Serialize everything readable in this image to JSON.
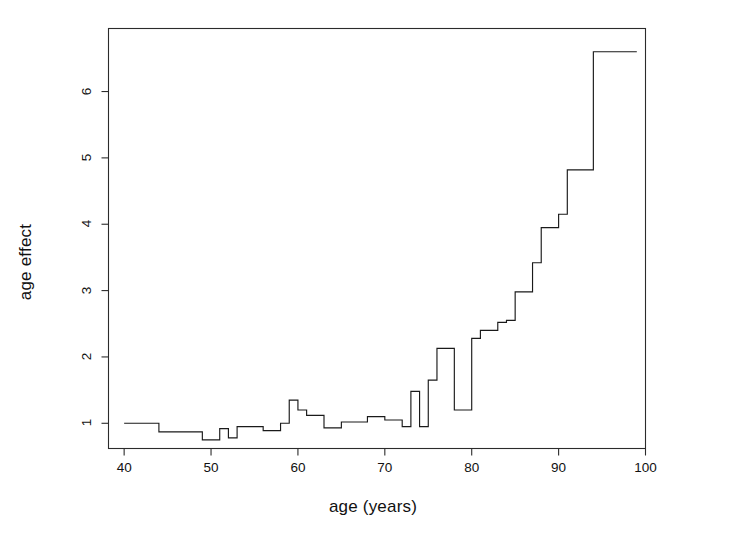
{
  "chart_data": {
    "type": "line",
    "subtype": "step",
    "title": "",
    "xlabel": "age (years)",
    "ylabel": "age effect",
    "xlim": [
      38.2,
      100.0
    ],
    "ylim": [
      0.62,
      6.95
    ],
    "xticks": [
      40,
      50,
      60,
      70,
      80,
      90,
      100
    ],
    "xtick_labels": [
      "40",
      "50",
      "60",
      "70",
      "80",
      "90",
      "100"
    ],
    "yticks": [
      1,
      2,
      3,
      4,
      5,
      6
    ],
    "ytick_labels": [
      "1",
      "2",
      "3",
      "4",
      "5",
      "6"
    ],
    "grid": false,
    "legend": null,
    "line_color": "#1a1a1a",
    "line_width": 1.1,
    "background": "#ffffff",
    "x": [
      40,
      41,
      42,
      43,
      44,
      45,
      46,
      47,
      48,
      49,
      50,
      51,
      52,
      53,
      54,
      55,
      56,
      57,
      58,
      59,
      60,
      61,
      62,
      63,
      64,
      65,
      66,
      67,
      68,
      69,
      70,
      71,
      72,
      73,
      74,
      75,
      76,
      77,
      78,
      79,
      80,
      81,
      82,
      83,
      84,
      85,
      86,
      87,
      88,
      89,
      90,
      91,
      92,
      93,
      94,
      95,
      96,
      97,
      98
    ],
    "values": [
      1.0,
      1.0,
      1.0,
      1.0,
      0.87,
      0.87,
      0.87,
      0.87,
      0.87,
      0.75,
      0.75,
      0.92,
      0.78,
      0.95,
      0.95,
      0.95,
      0.89,
      0.89,
      1.0,
      1.35,
      1.2,
      1.12,
      1.12,
      0.93,
      0.93,
      1.02,
      1.02,
      1.02,
      1.1,
      1.1,
      1.05,
      1.05,
      0.95,
      1.48,
      0.95,
      1.65,
      2.13,
      2.13,
      1.2,
      1.2,
      2.28,
      2.4,
      2.4,
      2.52,
      2.55,
      2.98,
      2.98,
      3.42,
      3.95,
      3.95,
      4.15,
      4.82,
      4.82,
      4.82,
      6.6,
      6.6,
      6.6,
      6.6,
      6.6
    ],
    "series_name": "age effect"
  },
  "axes": {
    "x_tick_labels": [
      "40",
      "50",
      "60",
      "70",
      "80",
      "90",
      "100"
    ],
    "y_tick_labels": [
      "1",
      "2",
      "3",
      "4",
      "5",
      "6"
    ],
    "x_axis_title": "age (years)",
    "y_axis_title": "age effect"
  }
}
